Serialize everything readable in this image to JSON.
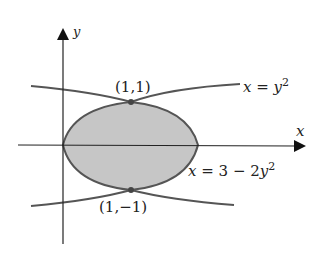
{
  "axes": {
    "x_label": "x",
    "y_label": "y"
  },
  "curves": [
    {
      "equation_lhs": "x",
      "eq": "=",
      "rhs_var": "y",
      "exp": "2",
      "name": "x = y^2"
    },
    {
      "equation_lhs": "x",
      "eq": "=",
      "rhs_const": "3",
      "minus": "−",
      "rhs_coef": "2",
      "rhs_var": "y",
      "exp": "2",
      "name": "x = 3 - 2y^2"
    }
  ],
  "points": [
    {
      "label": "(1,1)"
    },
    {
      "label": "(1,−1)"
    }
  ],
  "colors": {
    "curve": "#555555",
    "fill": "#c8c8c8",
    "axis": "#222222"
  }
}
